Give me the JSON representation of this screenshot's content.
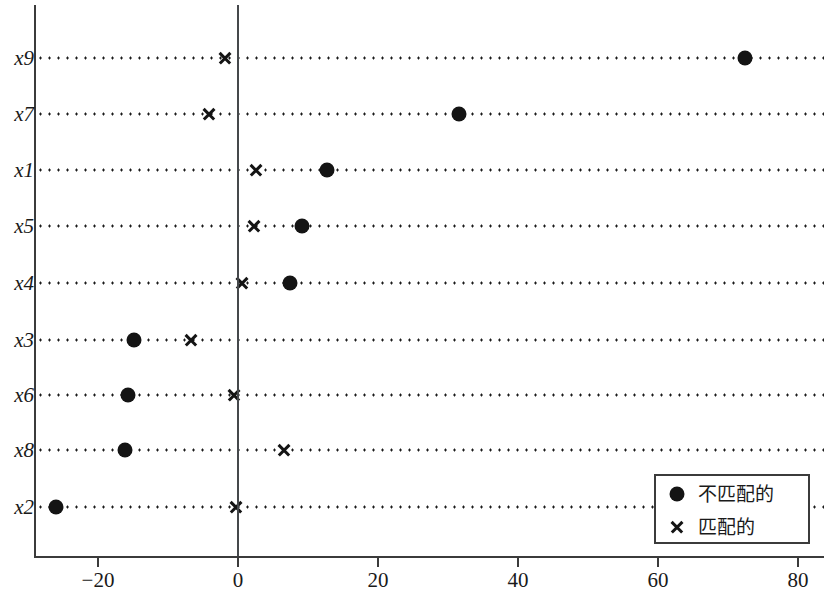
{
  "chart_data": {
    "type": "scatter",
    "title": "",
    "subtitle": "",
    "xlabel": "",
    "ylabel": "",
    "xlim": [
      -28.0,
      83.7
    ],
    "ylim": [
      0,
      10
    ],
    "grid": "dotted-horizontal-per-category",
    "zero_reference_line": 0,
    "legend_position": "bottom-right",
    "categories": [
      "x9",
      "x7",
      "x1",
      "x5",
      "x4",
      "x3",
      "x6",
      "x8",
      "x2"
    ],
    "series": [
      {
        "name": "不匹配的",
        "marker": "filled-circle",
        "color": "#141414",
        "values": [
          72.4,
          31.6,
          12.7,
          9.1,
          7.4,
          -14.9,
          -15.7,
          -16.1,
          -26.0
        ]
      },
      {
        "name": "匹配的",
        "marker": "x-cross",
        "color": "#141414",
        "values": [
          -1.9,
          -4.1,
          2.6,
          2.3,
          0.6,
          -6.7,
          -0.6,
          6.6,
          -0.3
        ]
      }
    ],
    "xticks": [
      -20,
      0,
      20,
      40,
      60,
      80
    ],
    "xtick_labels": [
      "−20",
      "0",
      "20",
      "40",
      "60",
      "80"
    ]
  },
  "legend": {
    "entries": [
      {
        "label": "不匹配的",
        "icon": "filled-circle-marker"
      },
      {
        "label": "匹配的",
        "icon": "x-cross-marker"
      }
    ]
  }
}
